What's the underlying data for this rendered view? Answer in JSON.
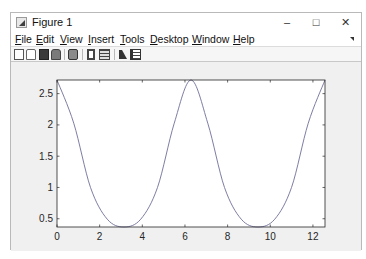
{
  "window": {
    "title": "Figure 1",
    "controls": {
      "minimize": "–",
      "maximize": "□",
      "close": "✕"
    }
  },
  "menubar": {
    "items": [
      {
        "label": "File",
        "accel": "F"
      },
      {
        "label": "Edit",
        "accel": "E"
      },
      {
        "label": "View",
        "accel": "V"
      },
      {
        "label": "Insert",
        "accel": "I"
      },
      {
        "label": "Tools",
        "accel": "T"
      },
      {
        "label": "Desktop",
        "accel": "D"
      },
      {
        "label": "Window",
        "accel": "W"
      },
      {
        "label": "Help",
        "accel": "H"
      }
    ]
  },
  "toolbar": {
    "tools": [
      "new-figure-icon",
      "open-file-icon",
      "save-icon",
      "print-icon",
      "print-preview-icon",
      "link-plot-icon",
      "insert-colorbar-icon",
      "edit-plot-arrow-icon",
      "property-inspector-icon"
    ]
  },
  "colors": {
    "line": "#6e6e9a",
    "axes_bg": "#ffffff",
    "figure_bg": "#f0f0f0",
    "axis": "#262626"
  },
  "chart_data": {
    "type": "line",
    "title": "",
    "xlabel": "",
    "ylabel": "",
    "xlim": [
      0,
      12.566
    ],
    "ylim": [
      0.368,
      2.718
    ],
    "xticks": [
      0,
      2,
      4,
      6,
      8,
      10,
      12
    ],
    "xtick_labels": [
      "0",
      "2",
      "4",
      "6",
      "8",
      "10",
      "12"
    ],
    "yticks": [
      0.5,
      1,
      1.5,
      2,
      2.5
    ],
    "ytick_labels": [
      "0.5",
      "1",
      "1.5",
      "2",
      "2.5"
    ],
    "grid": false,
    "legend": null,
    "series": [
      {
        "name": "exp(cos(x))",
        "x": [
          0,
          0.785,
          1.571,
          2.356,
          3.142,
          3.927,
          4.712,
          5.498,
          6.283,
          7.069,
          7.854,
          8.639,
          9.425,
          10.21,
          10.996,
          11.781,
          12.566
        ],
        "y": [
          2.718,
          2.028,
          1.0,
          0.493,
          0.368,
          0.493,
          1.0,
          2.028,
          2.718,
          2.028,
          1.0,
          0.493,
          0.368,
          0.493,
          1.0,
          2.028,
          2.718
        ]
      }
    ]
  }
}
